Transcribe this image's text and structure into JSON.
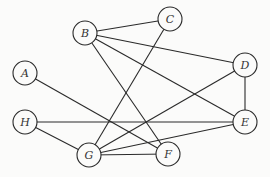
{
  "diagram": {
    "type": "undirected-graph",
    "node_radius": 12,
    "nodes": [
      {
        "id": "A",
        "label": "A",
        "x": 25,
        "y": 73
      },
      {
        "id": "B",
        "label": "B",
        "x": 85,
        "y": 33
      },
      {
        "id": "C",
        "label": "C",
        "x": 170,
        "y": 19
      },
      {
        "id": "D",
        "label": "D",
        "x": 245,
        "y": 65
      },
      {
        "id": "E",
        "label": "E",
        "x": 245,
        "y": 122
      },
      {
        "id": "F",
        "label": "F",
        "x": 168,
        "y": 154
      },
      {
        "id": "G",
        "label": "G",
        "x": 89,
        "y": 155
      },
      {
        "id": "H",
        "label": "H",
        "x": 25,
        "y": 122
      }
    ],
    "edges": [
      {
        "from": "B",
        "to": "C"
      },
      {
        "from": "B",
        "to": "D"
      },
      {
        "from": "B",
        "to": "E"
      },
      {
        "from": "B",
        "to": "F"
      },
      {
        "from": "C",
        "to": "G"
      },
      {
        "from": "D",
        "to": "E"
      },
      {
        "from": "D",
        "to": "G"
      },
      {
        "from": "E",
        "to": "H"
      },
      {
        "from": "E",
        "to": "G"
      },
      {
        "from": "A",
        "to": "F"
      },
      {
        "from": "H",
        "to": "G"
      },
      {
        "from": "G",
        "to": "F"
      }
    ],
    "colors": {
      "background": "#fbfbfa",
      "stroke": "#2a2a2a",
      "label": "#333333"
    }
  }
}
